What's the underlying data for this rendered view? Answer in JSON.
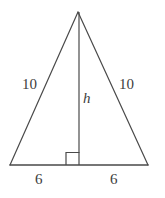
{
  "figure": {
    "name": "isosceles-triangle-with-altitude",
    "background_color": "#ffffff",
    "stroke_color": "#4a4a4a",
    "text_color": "#3d3d3d",
    "stroke_width": 1.2,
    "labels": {
      "side_left": "10",
      "side_right": "10",
      "altitude": "h",
      "base_left": "6",
      "base_right": "6"
    },
    "geometry": {
      "apex": {
        "x": 78,
        "y": 12
      },
      "base_left_vertex": {
        "x": 10,
        "y": 165
      },
      "base_right_vertex": {
        "x": 148,
        "y": 165
      },
      "altitude_foot": {
        "x": 79,
        "y": 165
      },
      "right_angle_marker": {
        "x": 66,
        "y": 152,
        "size": 13,
        "side": "left-of-altitude"
      }
    }
  }
}
